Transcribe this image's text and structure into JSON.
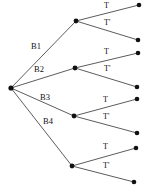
{
  "diagram": {
    "type": "probability-tree",
    "colors": {
      "background": "#ffffff",
      "edge": "#4a4a4a",
      "node": "#111111",
      "text": "#111111"
    },
    "root": {
      "name": "root-node",
      "x": 11,
      "y": 88
    },
    "stage1": {
      "count": 4,
      "labels": [
        "B1",
        "B2",
        "B3",
        "B4"
      ],
      "nodes": [
        {
          "label": "B1",
          "x": 76,
          "y": 21,
          "label_x": 31,
          "label_y": 42
        },
        {
          "label": "B2",
          "x": 75,
          "y": 68,
          "label_x": 34,
          "label_y": 65
        },
        {
          "label": "B3",
          "x": 74,
          "y": 116,
          "label_x": 40,
          "label_y": 93
        },
        {
          "label": "B4",
          "x": 72,
          "y": 166,
          "label_x": 43,
          "label_y": 117
        }
      ]
    },
    "stage2": {
      "labels": [
        "T",
        "T'"
      ],
      "label_t": "T",
      "label_tprime": "T'",
      "leaves": [
        {
          "parent": "B1",
          "label": "T",
          "x": 139,
          "y": 5,
          "label_x": 104,
          "label_y": 2
        },
        {
          "parent": "B1",
          "label": "T'",
          "x": 138,
          "y": 40,
          "label_x": 104,
          "label_y": 19
        },
        {
          "parent": "B2",
          "label": "T",
          "x": 138,
          "y": 53,
          "label_x": 104,
          "label_y": 48
        },
        {
          "parent": "B2",
          "label": "T'",
          "x": 137,
          "y": 87,
          "label_x": 104,
          "label_y": 65
        },
        {
          "parent": "B3",
          "label": "T",
          "x": 137,
          "y": 99,
          "label_x": 103,
          "label_y": 96
        },
        {
          "parent": "B3",
          "label": "T'",
          "x": 137,
          "y": 133,
          "label_x": 103,
          "label_y": 113
        },
        {
          "parent": "B4",
          "label": "T",
          "x": 136,
          "y": 148,
          "label_x": 103,
          "label_y": 143
        },
        {
          "parent": "B4",
          "label": "T'",
          "x": 134,
          "y": 182,
          "label_x": 103,
          "label_y": 162
        }
      ]
    }
  }
}
